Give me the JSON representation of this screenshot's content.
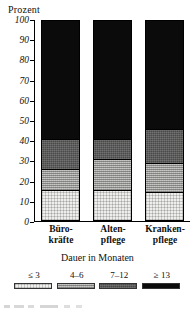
{
  "chart_data": {
    "type": "bar",
    "subtype": "stacked-100",
    "title": "",
    "ylabel": "Prozent",
    "xlabel": "",
    "ylim": [
      0,
      100
    ],
    "yticks": [
      0,
      10,
      20,
      30,
      40,
      50,
      60,
      70,
      80,
      90,
      100
    ],
    "ytick_labels": [
      "0",
      "10",
      "20",
      "30",
      "40",
      "50",
      "60",
      "70",
      "80",
      "90",
      "100"
    ],
    "grid": false,
    "legend_position": "bottom",
    "legend_title": "Dauer in Monaten",
    "categories": [
      "Büro-kräfte",
      "Alten-pflege",
      "Kranken-pflege"
    ],
    "category_lines": [
      [
        "Büro-",
        "kräfte"
      ],
      [
        "Alten-",
        "pflege"
      ],
      [
        "Kranken-",
        "pflege"
      ]
    ],
    "series": [
      {
        "name": "≤ 3",
        "color": "#eeeeec",
        "values": [
          15,
          15,
          14
        ]
      },
      {
        "name": "4–6",
        "color": "#b7b7b4",
        "values": [
          10,
          15,
          14
        ]
      },
      {
        "name": "7–12",
        "color": "#4a4a49",
        "values": [
          15,
          10,
          17
        ]
      },
      {
        "name": "≥ 13",
        "color": "#0b0b0b",
        "values": [
          60,
          60,
          55
        ]
      }
    ],
    "boundaries": {
      "Büro-kräfte": [
        15,
        25,
        40,
        100
      ],
      "Alten-pflege": [
        15,
        30,
        40,
        100
      ],
      "Kranken-pflege": [
        14,
        28,
        45,
        100
      ]
    }
  },
  "legend": {
    "title": "Dauer in Monaten",
    "items": [
      {
        "label": "≤ 3"
      },
      {
        "label": "4–6"
      },
      {
        "label": "7–12"
      },
      {
        "label": "≥ 13"
      }
    ]
  }
}
